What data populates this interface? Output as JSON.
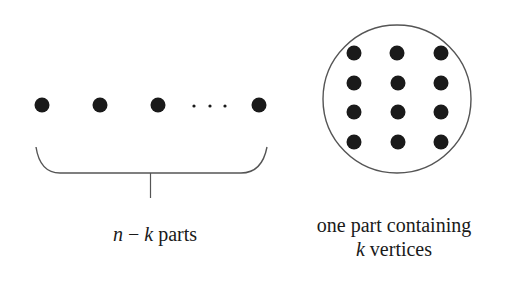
{
  "diagram": {
    "colors": {
      "vertex": "#1a1a1a",
      "line": "#555555",
      "text": "#1a1a1a",
      "background": "#ffffff"
    },
    "left_group": {
      "vertices": [
        {
          "cx": 42,
          "cy": 105
        },
        {
          "cx": 100,
          "cy": 105
        },
        {
          "cx": 158,
          "cy": 105
        },
        {
          "cx": 259,
          "cy": 105
        }
      ],
      "ellipsis_dots": [
        {
          "cx": 194,
          "cy": 106
        },
        {
          "cx": 210,
          "cy": 106
        },
        {
          "cx": 225,
          "cy": 106
        }
      ],
      "brace": "under",
      "label": {
        "var_n": "n",
        "minus": " − ",
        "var_k": "k",
        "text": " parts"
      }
    },
    "right_group": {
      "circle": {
        "cx": 397,
        "cy": 99,
        "r": 74
      },
      "grid": {
        "rows": 4,
        "cols": 3
      },
      "vertices": [
        {
          "cx": 354,
          "cy": 53
        },
        {
          "cx": 397,
          "cy": 53
        },
        {
          "cx": 441,
          "cy": 53
        },
        {
          "cx": 354,
          "cy": 83
        },
        {
          "cx": 398,
          "cy": 83
        },
        {
          "cx": 441,
          "cy": 83
        },
        {
          "cx": 354,
          "cy": 112
        },
        {
          "cx": 398,
          "cy": 112
        },
        {
          "cx": 441,
          "cy": 112
        },
        {
          "cx": 354,
          "cy": 142
        },
        {
          "cx": 398,
          "cy": 142
        },
        {
          "cx": 441,
          "cy": 142
        }
      ],
      "label": {
        "line1": "one part containing",
        "var_k": "k",
        "line2_rest": " vertices"
      }
    }
  }
}
